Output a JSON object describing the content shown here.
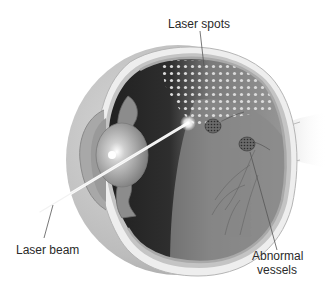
{
  "figure": {
    "labels": [
      {
        "id": "laser-spots",
        "text": "Laser spots"
      },
      {
        "id": "laser-beam",
        "text": "Laser beam"
      },
      {
        "id": "abnormal-vessels",
        "lines": [
          "Abnormal",
          "vessels"
        ]
      }
    ]
  },
  "colors": {
    "background": "#ffffff",
    "sclera_outer": "#c8c8c8",
    "sclera_band": "#e6e6e6",
    "interior_dark": "#3a3a3a",
    "retina": "#8e8e8e",
    "laser_spot": "#d8d8d8",
    "beam": "#ffffff",
    "label_text": "#2a2a2a",
    "leader_line": "#555555"
  }
}
